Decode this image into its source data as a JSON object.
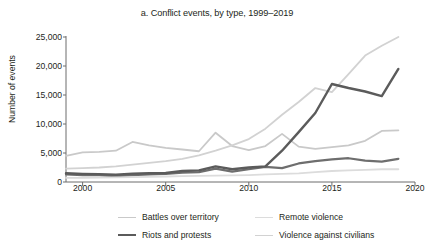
{
  "chart_data": {
    "type": "line",
    "title": "a. Conflict events, by type, 1999–2019",
    "xlabel": "",
    "ylabel": "Number of events",
    "xlim": [
      1999,
      2020
    ],
    "ylim": [
      0,
      25000
    ],
    "grid": false,
    "legend_position": "bottom",
    "x_ticks": [
      "2000",
      "2005",
      "2010",
      "2015",
      "2020"
    ],
    "x_tick_values": [
      2000,
      2005,
      2010,
      2015,
      2020
    ],
    "y_ticks": [
      "0",
      "5,000",
      "10,000",
      "15,000",
      "20,000",
      "25,000"
    ],
    "y_tick_values": [
      0,
      5000,
      10000,
      15000,
      20000,
      25000
    ],
    "x": [
      1999,
      2000,
      2001,
      2002,
      2003,
      2004,
      2005,
      2006,
      2007,
      2008,
      2009,
      2010,
      2011,
      2012,
      2013,
      2014,
      2015,
      2016,
      2017,
      2018,
      2019
    ],
    "series": [
      {
        "name": "Battles over territory",
        "color": "#c9c9c9",
        "width": 1.8,
        "values": [
          4500,
          5100,
          5200,
          5400,
          6900,
          6300,
          5900,
          5600,
          5300,
          8500,
          6200,
          5500,
          6200,
          8300,
          6100,
          5700,
          6000,
          6300,
          7100,
          8800,
          8900
        ]
      },
      {
        "name": "Riots and protests",
        "color": "#6e6e6e",
        "width": 2.2,
        "values": [
          1300,
          1200,
          1200,
          1000,
          1200,
          1300,
          1400,
          1600,
          1700,
          2300,
          1800,
          2200,
          2600,
          2400,
          3200,
          3600,
          3900,
          4100,
          3700,
          3500,
          4000
        ]
      },
      {
        "name": "Remote violence",
        "color": "#dcdcdc",
        "width": 1.8,
        "values": [
          700,
          700,
          750,
          800,
          850,
          900,
          950,
          1000,
          1050,
          1100,
          1150,
          1200,
          1300,
          1400,
          1500,
          1700,
          1900,
          2000,
          2100,
          2200,
          2200
        ]
      },
      {
        "name": "Violence against civilians",
        "color": "#d2d2d2",
        "width": 1.8,
        "values": [
          2300,
          2400,
          2500,
          2700,
          3000,
          3300,
          3600,
          4000,
          4600,
          5400,
          6300,
          7400,
          9200,
          11600,
          13800,
          16200,
          15500,
          18600,
          21800,
          23500,
          25000
        ]
      },
      {
        "name": "Riots and protests (emphasis)",
        "color": "#5b5b5b",
        "width": 2.4,
        "values": [
          1500,
          1400,
          1350,
          1250,
          1450,
          1500,
          1550,
          1900,
          2000,
          2700,
          2200,
          2500,
          2700,
          5400,
          8600,
          11900,
          16900,
          16200,
          15600,
          14800,
          19500
        ]
      }
    ]
  },
  "legend": {
    "items": [
      {
        "label": "Battles over territory",
        "color": "#c9c9c9",
        "thickness": "1.6px"
      },
      {
        "label": "Remote violence",
        "color": "#dcdcdc",
        "thickness": "1.6px"
      },
      {
        "label": "Riots and protests",
        "color": "#5b5b5b",
        "thickness": "2.4px"
      },
      {
        "label": "Violence against civilians",
        "color": "#d2d2d2",
        "thickness": "1.6px"
      }
    ]
  },
  "axis": {
    "line_color": "#6d6d6d"
  }
}
